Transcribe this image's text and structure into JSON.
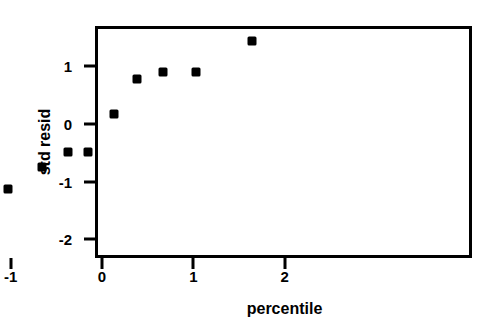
{
  "chart_data": {
    "type": "scatter",
    "title": "",
    "xlabel": "percentile",
    "ylabel": "std resid",
    "xlim": [
      -2.15,
      2.0
    ],
    "ylim": [
      -2.05,
      1.7
    ],
    "grid": false,
    "legend": null,
    "xticks": [
      -2,
      -1,
      0,
      1,
      2
    ],
    "xtick_labels": [
      "-2",
      "-1",
      "0",
      "1",
      "2"
    ],
    "yticks": [
      1,
      0,
      -1,
      -2
    ],
    "ytick_labels": [
      "1",
      "0",
      "-1",
      "-2"
    ],
    "marker": "filled-square",
    "marker_color": "#000000",
    "points": [
      {
        "x": -1.65,
        "y": -1.78
      },
      {
        "x": -1.03,
        "y": -1.12
      },
      {
        "x": -0.66,
        "y": -0.74
      },
      {
        "x": -0.37,
        "y": -0.48
      },
      {
        "x": -0.15,
        "y": -0.48
      },
      {
        "x": 0.13,
        "y": 0.18
      },
      {
        "x": 0.38,
        "y": 0.78
      },
      {
        "x": 0.67,
        "y": 0.9
      },
      {
        "x": 1.03,
        "y": 0.91
      },
      {
        "x": 1.64,
        "y": 1.44
      }
    ]
  },
  "figure": {
    "background": "#ffffff",
    "axis_color": "#000000"
  }
}
